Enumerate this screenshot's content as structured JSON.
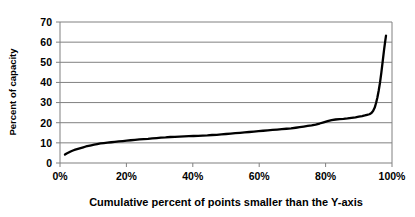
{
  "chart_data": {
    "type": "line",
    "title": "",
    "xlabel": "Cumulative percent of points smaller than the Y-axis",
    "ylabel": "Percent of capacity",
    "xlim": [
      0,
      100
    ],
    "ylim": [
      0,
      70
    ],
    "grid": "horizontal",
    "legend": "none",
    "line_color": "#000000",
    "axis_color": "#808080",
    "gridline_color": "#808080",
    "background_color": "#ffffff",
    "xticks": [
      0,
      20,
      40,
      60,
      80,
      100
    ],
    "xtick_labels": [
      "0%",
      "20%",
      "40%",
      "60%",
      "80%",
      "100%"
    ],
    "yticks": [
      0,
      10,
      20,
      30,
      40,
      50,
      60,
      70
    ],
    "ytick_labels": [
      "0",
      "10",
      "20",
      "30",
      "40",
      "50",
      "60",
      "70"
    ],
    "series": [
      {
        "name": "Percent of capacity",
        "x": [
          1.5,
          2.0,
          2.6,
          3.2,
          3.9,
          4.6,
          5.4,
          6.2,
          7.0,
          7.8,
          8.6,
          9.4,
          10.3,
          11.2,
          12.2,
          13.2,
          14.3,
          15.4,
          16.5,
          17.7,
          18.9,
          20.1,
          21.3,
          22.6,
          23.9,
          25.2,
          26.5,
          27.8,
          29.1,
          30.4,
          31.8,
          33.2,
          34.6,
          36.0,
          37.4,
          38.8,
          40.2,
          41.6,
          43.0,
          44.4,
          45.8,
          47.2,
          48.6,
          50.0,
          51.4,
          52.8,
          54.2,
          55.6,
          57.0,
          58.4,
          59.8,
          61.2,
          62.6,
          64.0,
          65.4,
          66.8,
          68.2,
          69.6,
          71.0,
          72.2,
          73.4,
          74.6,
          75.8,
          77.0,
          78.2,
          79.4,
          80.6,
          81.8,
          83.0,
          84.2,
          85.4,
          86.6,
          87.8,
          89.0,
          90.0,
          91.0,
          91.8,
          92.5,
          93.2,
          93.8,
          94.3,
          94.8,
          95.2,
          95.6,
          96.0,
          96.4,
          96.8,
          97.2,
          97.6,
          98.0,
          98.2
        ],
        "y": [
          4.2,
          4.7,
          5.2,
          5.7,
          6.2,
          6.6,
          7.0,
          7.4,
          7.8,
          8.2,
          8.5,
          8.8,
          9.1,
          9.4,
          9.7,
          9.9,
          10.1,
          10.3,
          10.5,
          10.7,
          10.9,
          11.1,
          11.3,
          11.5,
          11.7,
          11.9,
          12.0,
          12.2,
          12.4,
          12.6,
          12.7,
          12.9,
          13.0,
          13.1,
          13.2,
          13.3,
          13.4,
          13.5,
          13.6,
          13.7,
          13.9,
          14.0,
          14.2,
          14.4,
          14.6,
          14.8,
          15.0,
          15.2,
          15.4,
          15.6,
          15.8,
          16.0,
          16.2,
          16.4,
          16.6,
          16.8,
          17.0,
          17.2,
          17.5,
          17.8,
          18.1,
          18.4,
          18.7,
          19.1,
          19.6,
          20.2,
          20.8,
          21.3,
          21.6,
          21.8,
          21.9,
          22.1,
          22.4,
          22.7,
          23.0,
          23.3,
          23.6,
          23.9,
          24.2,
          24.8,
          25.8,
          27.5,
          29.8,
          32.5,
          36.0,
          40.0,
          45.0,
          50.5,
          56.0,
          61.0,
          63.2
        ]
      }
    ],
    "annotations": {
      "start_value": 4.2,
      "peak_value": 63.2,
      "plateau_value": 24.0,
      "description": "Cumulative distribution curve rising slowly from about 4 percent to about 24 percent of capacity, then spiking sharply above 60 percent near the 100 percent cumulative point."
    }
  }
}
